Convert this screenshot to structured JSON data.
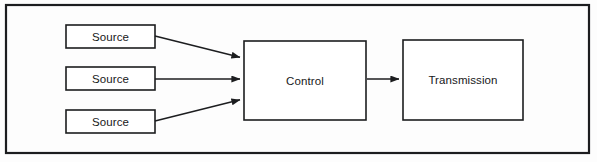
{
  "diagram": {
    "type": "block-flow-diagram",
    "background_color": "#fdfdfd",
    "stroke_color": "#1c1d1f",
    "frame": {
      "name": "outer-frame",
      "x": 6,
      "y": 5,
      "width": 583,
      "height": 148,
      "stroke_width": 2.2
    },
    "nodes": [
      {
        "id": "source-1",
        "label": "Source",
        "x": 66,
        "y": 25,
        "width": 89,
        "height": 23
      },
      {
        "id": "source-2",
        "label": "Source",
        "x": 66,
        "y": 67,
        "width": 89,
        "height": 23
      },
      {
        "id": "source-3",
        "label": "Source",
        "x": 66,
        "y": 110,
        "width": 89,
        "height": 23
      },
      {
        "id": "control",
        "label": "Control",
        "x": 244,
        "y": 41,
        "width": 122,
        "height": 79
      },
      {
        "id": "transmission",
        "label": "Transmission",
        "x": 403,
        "y": 40,
        "width": 120,
        "height": 80
      }
    ],
    "edges": [
      {
        "id": "edge-source1-control",
        "from": "source-1",
        "to": "control",
        "x1": 155,
        "y1": 36,
        "x2": 243,
        "y2": 58
      },
      {
        "id": "edge-source2-control",
        "from": "source-2",
        "to": "control",
        "x1": 155,
        "y1": 79,
        "x2": 243,
        "y2": 79
      },
      {
        "id": "edge-source3-control",
        "from": "source-3",
        "to": "control",
        "x1": 155,
        "y1": 121,
        "x2": 243,
        "y2": 99
      },
      {
        "id": "edge-control-transmission",
        "from": "control",
        "to": "transmission",
        "x1": 367,
        "y1": 79,
        "x2": 402,
        "y2": 79
      }
    ]
  }
}
